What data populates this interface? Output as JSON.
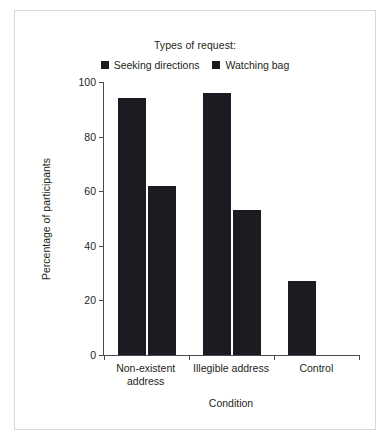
{
  "chart_data": {
    "type": "bar",
    "title": "",
    "legend_title": "Types of request:",
    "legend_position": "top-center",
    "categories": [
      "Non-existent address",
      "Illegible address",
      "Control"
    ],
    "category_lines": [
      [
        "Non-existent",
        "address"
      ],
      [
        "Illegible address"
      ],
      [
        "Control"
      ]
    ],
    "series": [
      {
        "name": "Seeking directions",
        "color": "#1c1b22",
        "values": [
          94,
          96,
          27
        ]
      },
      {
        "name": "Watching bag",
        "color": "#1c1b22",
        "values": [
          62,
          53,
          null
        ]
      }
    ],
    "xlabel": "Condition",
    "ylabel": "Percentage of participants",
    "ylim": [
      0,
      100
    ],
    "yticks": [
      0,
      20,
      40,
      60,
      80,
      100
    ],
    "ytick_labels": [
      "0",
      "20",
      "40",
      "60",
      "80",
      "100"
    ],
    "grid": false,
    "bar_color": "#1c1b22",
    "axis_color": "#4a4a52",
    "frame_color": "#d9d9d9",
    "background": "#ffffff"
  }
}
